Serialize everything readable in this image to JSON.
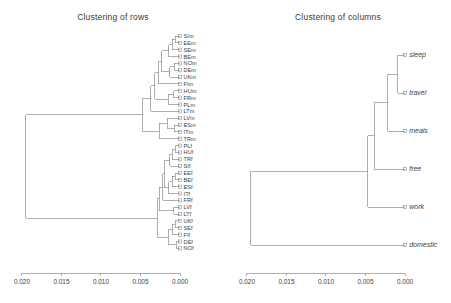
{
  "figure": {
    "background": "#ffffff",
    "line_color": "#8d8d8d",
    "text_color": "#3c3c3c",
    "width": 451,
    "height": 303
  },
  "panels": {
    "rows": {
      "title": "Clustering of rows"
    },
    "columns": {
      "title": "Clustering of columns"
    }
  },
  "axis": {
    "ticks": [
      "0.020",
      "0.015",
      "0.010",
      "0.005",
      "0.000"
    ],
    "values": [
      0.02,
      0.015,
      0.01,
      0.005,
      0.0
    ],
    "reversed": true,
    "min": 0.0,
    "max": 0.0205
  },
  "chart_data": {
    "type": "dendrogram",
    "panels": [
      {
        "name": "rows",
        "title": "Clustering of rows",
        "xlabel": "",
        "ylabel": "",
        "axis_direction": "reversed",
        "xlim": [
          0.0205,
          0.0
        ],
        "distance_ticks": [
          0.02,
          0.015,
          0.01,
          0.005,
          0.0
        ],
        "n_leaves": 35,
        "leaves": [
          "SIm",
          "EEm",
          "SEm",
          "BEm",
          "NOm",
          "DEm",
          "UKm",
          "FIm",
          "HUm",
          "FRm",
          "PLm",
          "LTm",
          "LVm",
          "ESm",
          "ITm",
          "TRm",
          "PLf",
          "HUf",
          "TRf",
          "SIf",
          "EEf",
          "BEf",
          "ESf",
          "ITf",
          "FRf",
          "LVf",
          "LTf",
          "UKf",
          "SEf",
          "FIf",
          "DEf",
          "NOf"
        ],
        "leaf_count": 32,
        "root_height": 0.0195,
        "clusters": [
          {
            "label": "male-cluster",
            "members": [
              "SIm",
              "EEm",
              "SEm",
              "BEm",
              "NOm",
              "DEm",
              "UKm",
              "FIm",
              "HUm",
              "FRm",
              "PLm",
              "LTm",
              "LVm",
              "ESm",
              "ITm",
              "TRm"
            ],
            "height": 0.0048
          },
          {
            "label": "female-cluster",
            "members": [
              "PLf",
              "HUf",
              "TRf",
              "SIf",
              "EEf",
              "BEf",
              "ESf",
              "ITf",
              "FRf",
              "LVf",
              "LTf",
              "UKf",
              "SEf",
              "FIf",
              "DEf",
              "NOf"
            ],
            "height": 0.0029
          }
        ]
      },
      {
        "name": "columns",
        "title": "Clustering of columns",
        "xlabel": "",
        "ylabel": "",
        "axis_direction": "reversed",
        "xlim": [
          0.0205,
          0.0
        ],
        "distance_ticks": [
          0.02,
          0.015,
          0.01,
          0.005,
          0.0
        ],
        "n_leaves": 6,
        "leaves": [
          "sleep",
          "travel",
          "meals",
          "free",
          "work",
          "domestic"
        ],
        "root_height": 0.0195,
        "merges": [
          {
            "pair": [
              "sleep",
              "travel"
            ],
            "height": 0.0009
          },
          {
            "pair": [
              "sleep+travel",
              "meals"
            ],
            "height": 0.0022
          },
          {
            "pair": [
              "sleep+travel+meals",
              "free"
            ],
            "height": 0.0039
          },
          {
            "pair": [
              "sleep+travel+meals+free",
              "work"
            ],
            "height": 0.0047
          },
          {
            "pair": [
              "all-activities",
              "domestic"
            ],
            "height": 0.0195
          }
        ]
      }
    ]
  },
  "rows_leaves": [
    "SIm",
    "EEm",
    "SEm",
    "BEm",
    "NOm",
    "DEm",
    "UKm",
    "FIm",
    "HUm",
    "FRm",
    "PLm",
    "LTm",
    "LVm",
    "ESm",
    "ITm",
    "TRm",
    "PLf",
    "HUf",
    "TRf",
    "SIf",
    "EEf",
    "BEf",
    "ESf",
    "ITf",
    "FRf",
    "LVf",
    "LTf",
    "UKf",
    "SEf",
    "FIf",
    "DEf",
    "NOf"
  ],
  "cols_leaves": [
    "sleep",
    "travel",
    "meals",
    "free",
    "work",
    "domestic"
  ]
}
